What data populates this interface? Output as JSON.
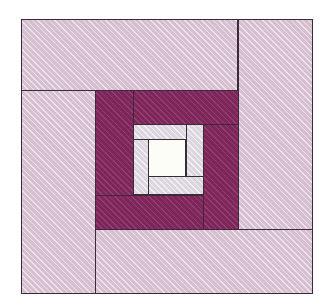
{
  "figure": {
    "kind": "quilt-block-diagram",
    "name": "Log Cabin Spiral Quilt Block",
    "width": 333,
    "height": 306
  },
  "colors": {
    "light_pink": "#ddc8d6",
    "dark_magenta": "#8a2a63",
    "light_grey": "#e4e0e6",
    "white": "#fdfdf7",
    "outline": "#3a2a3a",
    "background": "#ffffff"
  },
  "block": {
    "origin_x": 21,
    "origin_y": 19,
    "size_w": 292,
    "size_h": 275,
    "rings": [
      {
        "ring_index": 1,
        "fabric": "light_pink",
        "fabric_label": "Light Pink",
        "strip_count": 4
      },
      {
        "ring_index": 2,
        "fabric": "dark_magenta",
        "fabric_label": "Dark Magenta",
        "strip_count": 4
      },
      {
        "ring_index": 3,
        "fabric": "light_grey",
        "fabric_label": "Light Grey",
        "strip_count": 4
      },
      {
        "ring_index": 4,
        "fabric": "white",
        "fabric_label": "White Center",
        "strip_count": 1
      }
    ]
  },
  "patches": [
    {
      "id": "outer-top",
      "label": "Outer Top Strip",
      "fabric": "light_pink",
      "x": 21,
      "y": 19,
      "w": 217,
      "h": 72
    },
    {
      "id": "outer-right",
      "label": "Outer Right Strip",
      "fabric": "light_pink",
      "x": 238,
      "y": 19,
      "w": 75,
      "h": 211
    },
    {
      "id": "outer-bottom",
      "label": "Outer Bottom Strip",
      "fabric": "light_pink",
      "x": 95,
      "y": 229,
      "w": 218,
      "h": 65
    },
    {
      "id": "outer-left",
      "label": "Outer Left Strip",
      "fabric": "light_pink",
      "x": 21,
      "y": 90,
      "w": 75,
      "h": 204
    },
    {
      "id": "mid-left",
      "label": "Middle Left Strip",
      "fabric": "dark_magenta",
      "x": 95,
      "y": 90,
      "w": 39,
      "h": 106
    },
    {
      "id": "mid-top",
      "label": "Middle Top Strip",
      "fabric": "dark_magenta",
      "x": 133,
      "y": 90,
      "w": 106,
      "h": 35
    },
    {
      "id": "mid-right",
      "label": "Middle Right Strip",
      "fabric": "dark_magenta",
      "x": 203,
      "y": 124,
      "w": 36,
      "h": 106
    },
    {
      "id": "mid-bottom",
      "label": "Middle Bottom Strip",
      "fabric": "dark_magenta",
      "x": 95,
      "y": 195,
      "w": 109,
      "h": 35
    },
    {
      "id": "inner-top",
      "label": "Inner Top Strip",
      "fabric": "light_grey",
      "x": 133,
      "y": 124,
      "w": 54,
      "h": 33
    },
    {
      "id": "inner-right",
      "label": "Inner Right Strip",
      "fabric": "light_grey",
      "x": 186,
      "y": 124,
      "w": 18,
      "h": 71
    },
    {
      "id": "inner-bottom",
      "label": "Inner Bottom Strip",
      "fabric": "light_grey",
      "x": 148,
      "y": 176,
      "w": 56,
      "h": 19
    },
    {
      "id": "inner-left",
      "label": "Inner Left Strip",
      "fabric": "light_grey",
      "x": 133,
      "y": 139,
      "w": 16,
      "h": 56
    },
    {
      "id": "center-square",
      "label": "Center Square",
      "fabric": "white",
      "x": 148,
      "y": 139,
      "w": 38,
      "h": 38
    }
  ]
}
